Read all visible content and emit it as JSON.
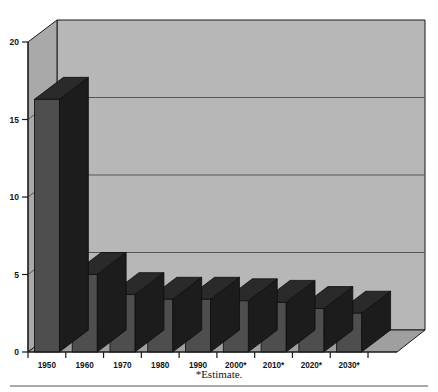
{
  "figure": {
    "footnote": "*Estimate.",
    "background_color": "#ffffff"
  },
  "colors": {
    "wall_back": "#b7b7b7",
    "wall_side": "#a9a9a9",
    "floor": "#9f9f9f",
    "bar_front": "#4e4e4e",
    "bar_side": "#1c1c1c",
    "bar_top": "#2a2a2a",
    "axis_line": "#1a1a1a",
    "gridline": "#565656",
    "rule": "#555555"
  },
  "chart_data": {
    "type": "bar",
    "title": "",
    "xlabel": "",
    "ylabel": "",
    "ylim": [
      0,
      20
    ],
    "yticks": [
      0,
      5,
      10,
      15,
      20
    ],
    "ytick_labels": [
      "0",
      "5",
      "10",
      "15",
      "20"
    ],
    "grid": true,
    "grid_axis": "y",
    "legend": "none",
    "style_3d": true,
    "annotations": [
      "*Estimate."
    ],
    "categories": [
      "1950",
      "1960",
      "1970",
      "1980",
      "1990",
      "2000*",
      "2010*",
      "2020*",
      "2030*"
    ],
    "values": [
      16.3,
      5.0,
      3.7,
      3.4,
      3.4,
      3.3,
      3.2,
      2.8,
      2.5
    ],
    "series": [
      {
        "name": "Series 1",
        "values": [
          16.3,
          5.0,
          3.7,
          3.4,
          3.4,
          3.3,
          3.2,
          2.8,
          2.5
        ]
      }
    ]
  }
}
